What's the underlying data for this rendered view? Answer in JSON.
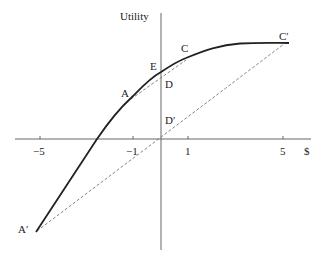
{
  "diagram": {
    "y_axis_label": "Utility",
    "x_axis_label": "$",
    "x_ticks": [
      "−5",
      "−1",
      "1",
      "5"
    ],
    "points": {
      "A": "A",
      "A_prime": "A′",
      "C": "C",
      "C_prime": "C′",
      "D": "D",
      "D_prime": "D′",
      "E": "E"
    },
    "colors": {
      "curve": "#222222",
      "axis": "#555555",
      "dashed": "#777777"
    }
  }
}
